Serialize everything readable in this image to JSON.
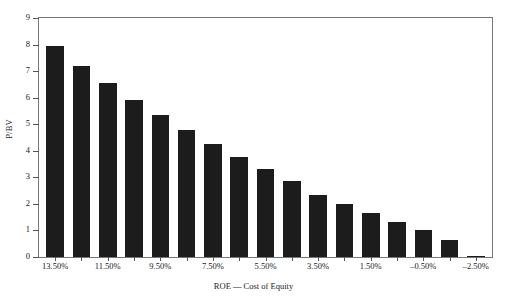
{
  "chart_data": {
    "type": "bar",
    "title": "",
    "xlabel": "ROE — Cost of Equity",
    "ylabel": "P/BV",
    "ylim": [
      0,
      9
    ],
    "ytick_labels": [
      "9",
      "8",
      "7",
      "6",
      "5",
      "4",
      "3",
      "2",
      "1",
      "0"
    ],
    "ytick_values": [
      9,
      8,
      7,
      6,
      5,
      4,
      3,
      2,
      1,
      0
    ],
    "grid": false,
    "legend": null,
    "bar_color": "#1c1c1c",
    "categories": [
      "13.50%",
      "13.00%",
      "11.50%",
      "11.00%",
      "9.50%",
      "9.00%",
      "7.50%",
      "7.00%",
      "5.50%",
      "5.00%",
      "3.50%",
      "3.00%",
      "1.50%",
      "1.00%",
      "-0.50%",
      "-2.50%",
      "-3.00%"
    ],
    "values": [
      7.95,
      7.2,
      6.55,
      5.9,
      5.35,
      4.8,
      4.25,
      3.75,
      3.3,
      2.85,
      2.35,
      2.0,
      1.65,
      1.3,
      1.0,
      0.65,
      0.05
    ],
    "xtick_labels": [
      "13.50%",
      "11.50%",
      "9.50%",
      "7.50%",
      "5.50%",
      "3.50%",
      "1.50%",
      "–0.50%",
      "–2.50%"
    ],
    "xtick_indices": [
      0,
      2,
      4,
      6,
      8,
      10,
      12,
      14,
      16
    ]
  }
}
